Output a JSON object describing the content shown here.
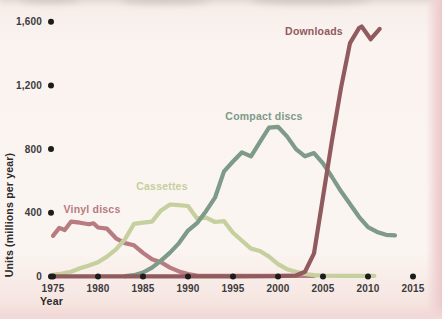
{
  "chart_data": {
    "type": "line",
    "title": "",
    "xlabel": "Year",
    "ylabel": "Units (millions per year)",
    "grid": false,
    "legend_position": "inline-labels",
    "xlim": [
      1975,
      2016.5
    ],
    "ylim": [
      0,
      1650
    ],
    "x_ticks": [
      1975,
      1980,
      1985,
      1990,
      1995,
      2000,
      2005,
      2010,
      2015
    ],
    "x_tick_labels": [
      "1975",
      "1980",
      "1985",
      "1990",
      "1995",
      "2000",
      "2005",
      "2010",
      "2015"
    ],
    "y_ticks": [
      0,
      400,
      800,
      1200,
      1600
    ],
    "y_tick_labels": [
      "0",
      "400",
      "800",
      "1,200",
      "1,600"
    ],
    "tick_marker": "filled-dot",
    "series": [
      {
        "name": "Vinyl discs",
        "color": "#b77b81",
        "label_x": 92,
        "label_y": 213,
        "points": [
          [
            1975,
            255
          ],
          [
            1975.7,
            305
          ],
          [
            1976.3,
            292
          ],
          [
            1977,
            344
          ],
          [
            1978,
            338
          ],
          [
            1979,
            328
          ],
          [
            1979.5,
            334
          ],
          [
            1980,
            308
          ],
          [
            1981,
            300
          ],
          [
            1982,
            240
          ],
          [
            1983,
            210
          ],
          [
            1984,
            196
          ],
          [
            1985,
            148
          ],
          [
            1986,
            108
          ],
          [
            1987,
            90
          ],
          [
            1988,
            56
          ],
          [
            1989,
            32
          ],
          [
            1990,
            15
          ],
          [
            1991,
            6
          ],
          [
            1993,
            4
          ],
          [
            2004,
            4
          ]
        ]
      },
      {
        "name": "Cassettes",
        "color": "#c6cf9e",
        "label_x": 162,
        "label_y": 190,
        "points": [
          [
            1975,
            10
          ],
          [
            1976,
            18
          ],
          [
            1977,
            30
          ],
          [
            1978,
            52
          ],
          [
            1979,
            70
          ],
          [
            1980,
            90
          ],
          [
            1981,
            125
          ],
          [
            1982,
            170
          ],
          [
            1983,
            235
          ],
          [
            1984,
            330
          ],
          [
            1985,
            338
          ],
          [
            1986,
            345
          ],
          [
            1987,
            415
          ],
          [
            1988,
            452
          ],
          [
            1989,
            448
          ],
          [
            1990,
            443
          ],
          [
            1991,
            365
          ],
          [
            1992,
            370
          ],
          [
            1993,
            342
          ],
          [
            1994,
            348
          ],
          [
            1995,
            275
          ],
          [
            1996,
            225
          ],
          [
            1997,
            175
          ],
          [
            1998,
            160
          ],
          [
            1999,
            125
          ],
          [
            2000,
            78
          ],
          [
            2001,
            46
          ],
          [
            2002,
            30
          ],
          [
            2003,
            16
          ],
          [
            2004,
            8
          ],
          [
            2005,
            5
          ],
          [
            2007,
            4
          ],
          [
            2010.7,
            4
          ]
        ]
      },
      {
        "name": "Compact discs",
        "color": "#7e9a89",
        "label_x": 264,
        "label_y": 120,
        "points": [
          [
            1983,
            2
          ],
          [
            1984,
            8
          ],
          [
            1985,
            25
          ],
          [
            1986,
            55
          ],
          [
            1987,
            100
          ],
          [
            1988,
            150
          ],
          [
            1989,
            210
          ],
          [
            1990,
            288
          ],
          [
            1991,
            335
          ],
          [
            1992,
            410
          ],
          [
            1993,
            495
          ],
          [
            1994,
            660
          ],
          [
            1995,
            722
          ],
          [
            1996,
            780
          ],
          [
            1997,
            755
          ],
          [
            1998,
            845
          ],
          [
            1999,
            935
          ],
          [
            2000,
            940
          ],
          [
            2001,
            880
          ],
          [
            2002,
            800
          ],
          [
            2003,
            755
          ],
          [
            2004,
            775
          ],
          [
            2005,
            710
          ],
          [
            2006,
            625
          ],
          [
            2007,
            535
          ],
          [
            2008,
            455
          ],
          [
            2009,
            375
          ],
          [
            2010,
            310
          ],
          [
            2011,
            280
          ],
          [
            2012,
            262
          ],
          [
            2013,
            258
          ]
        ]
      },
      {
        "name": "Downloads",
        "color": "#915a5e",
        "label_x": 314,
        "label_y": 35,
        "points": [
          [
            1975,
            1
          ],
          [
            1995,
            1
          ],
          [
            2000,
            2
          ],
          [
            2002,
            6
          ],
          [
            2003,
            30
          ],
          [
            2004,
            145
          ],
          [
            2005,
            500
          ],
          [
            2006,
            855
          ],
          [
            2007,
            1185
          ],
          [
            2008,
            1465
          ],
          [
            2009,
            1560
          ],
          [
            2009.3,
            1570
          ],
          [
            2010.3,
            1490
          ],
          [
            2011.3,
            1555
          ]
        ]
      }
    ]
  },
  "colors": {
    "page_background": "#fbf5f1",
    "page_edge_pink": "#efd2d2",
    "tick_dot": "#1c1c1c",
    "tick_text": "#3d3b3c",
    "axis_title_text": "#2c2a2b"
  }
}
